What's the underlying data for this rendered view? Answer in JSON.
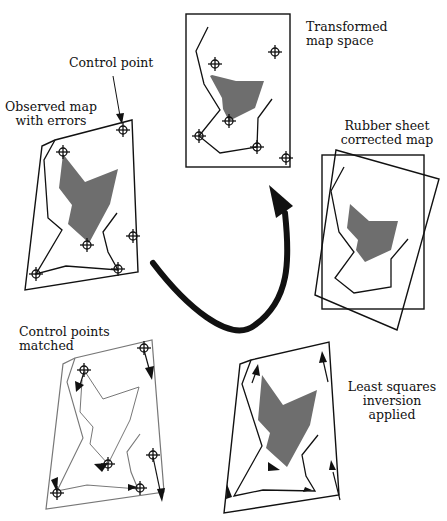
{
  "labels": {
    "control_point": "Control point",
    "observed_1": "Observed map",
    "observed_2": "with errors",
    "transformed_1": "Transformed",
    "transformed_2": "map space",
    "rubber_1": "Rubber sheet",
    "rubber_2": "corrected map",
    "matched_1": "Control points",
    "matched_2": "matched",
    "least_1": "Least squares",
    "least_2": "inversion",
    "least_3": "applied"
  },
  "colors": {
    "line": "#111111",
    "polygon_fill": "#6e6e6e",
    "matched_line": "#777777"
  },
  "panels": [
    "Observed map with errors",
    "Transformed map space",
    "Rubber sheet corrected map",
    "Least squares inversion applied",
    "Control points matched"
  ]
}
